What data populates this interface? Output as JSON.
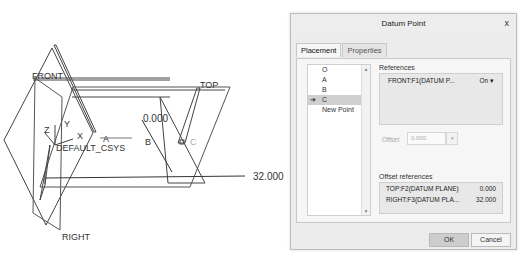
{
  "viewport": {
    "labels": {
      "front": "FRONT",
      "top": "TOP",
      "right": "RIGHT",
      "csys": "DEFAULT_CSYS",
      "axis_x": "X",
      "axis_y": "Y",
      "axis_z": "Z",
      "point_a": "A",
      "point_b": "B",
      "point_c": "C",
      "dim_offset_zero": "0.000",
      "dim_offset_32": "32.000"
    }
  },
  "dialog": {
    "title": "Datum Point",
    "close_label": "x",
    "tabs": [
      {
        "label": "Placement",
        "active": true
      },
      {
        "label": "Properties",
        "active": false
      }
    ],
    "points_list": {
      "items": [
        {
          "label": "O",
          "selected": false
        },
        {
          "label": "A",
          "selected": false
        },
        {
          "label": "B",
          "selected": false
        },
        {
          "label": "C",
          "selected": true
        },
        {
          "label": "New Point",
          "selected": false
        }
      ],
      "current_marker": "➜"
    },
    "references": {
      "label": "References",
      "rows": [
        {
          "name": "FRONT:F1(DATUM P...",
          "constraint": "On ▾"
        }
      ]
    },
    "offset": {
      "label": "Offset",
      "value": "0.000",
      "dropdown": "▾"
    },
    "offset_references": {
      "label": "Offset references",
      "rows": [
        {
          "name": "TOP:F2(DATUM PLANE)",
          "value": "0.000"
        },
        {
          "name": "RIGHT:F3(DATUM PLA...",
          "value": "32.000"
        }
      ]
    },
    "buttons": {
      "ok": "OK",
      "cancel": "Cancel"
    }
  }
}
